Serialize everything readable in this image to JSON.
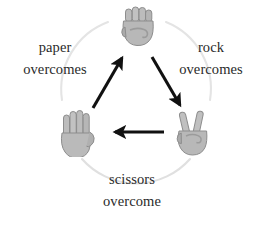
{
  "diagram": {
    "background_color": "#ffffff",
    "text_color": "#2a2a2a",
    "arrow_color": "#111111",
    "ring_color": "#e2e2e2",
    "hand_fill": "#b6b6b6",
    "hand_shade": "#9a9a9a",
    "hand_outline": "#8d8d8d"
  },
  "nodes": [
    {
      "id": "rock",
      "icon": "raised-fist-emoji",
      "position": "top-center"
    },
    {
      "id": "paper",
      "icon": "open-palm-emoji",
      "position": "bottom-left"
    },
    {
      "id": "scissors",
      "icon": "victory-hand-emoji",
      "position": "bottom-right"
    }
  ],
  "labels": {
    "paper": {
      "subject": "paper",
      "verb": "overcomes"
    },
    "rock": {
      "subject": "rock",
      "verb": "overcomes"
    },
    "scissors": {
      "subject": "scissors",
      "verb": "overcome"
    }
  },
  "arrows": [
    {
      "id": "paper-beats-rock",
      "from": "paper",
      "to": "rock",
      "direction": "up-right"
    },
    {
      "id": "rock-beats-scissors",
      "from": "rock",
      "to": "scissors",
      "direction": "down-right"
    },
    {
      "id": "scissors-beats-paper",
      "from": "scissors",
      "to": "paper",
      "direction": "left"
    }
  ]
}
